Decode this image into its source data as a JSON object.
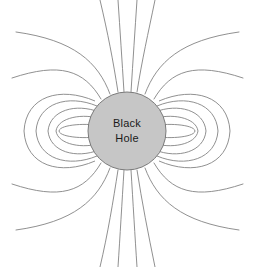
{
  "figure": {
    "width": 254,
    "height": 267,
    "background_color": "#ffffff",
    "caption": ""
  },
  "black_hole": {
    "label_line1": "Black",
    "label_line2": "Hole",
    "center_x": 127,
    "center_y": 131,
    "radius": 39,
    "fill_color": "#c6c6c6",
    "stroke_color": "#7a7a7a",
    "text_color": "#1a1a1a"
  },
  "field": {
    "line_color": "#838383",
    "line_width": 0.9,
    "open_line_count": 12,
    "closed_loop_count": 10,
    "symmetry": "dipole"
  },
  "chart_data": {
    "type": "line",
    "title": "",
    "subtitle": "",
    "xlabel": "",
    "ylabel": "",
    "grid": false,
    "legend": "none",
    "xlim": [
      0,
      254
    ],
    "ylim": [
      0,
      267
    ],
    "annotations": [
      {
        "text": "Black",
        "x": 127,
        "y": 124
      },
      {
        "text": "Hole",
        "x": 127,
        "y": 139
      }
    ],
    "series": [
      {
        "name": "open-field-line-upper-1",
        "path": "M 118 92 C 113 60, 108 34, 100 0"
      },
      {
        "name": "open-field-line-upper-2",
        "path": "M 124 92 C 122 60, 120 30, 118 0"
      },
      {
        "name": "open-field-line-upper-3",
        "path": "M 131 92 C 133 60, 135 30, 137 0"
      },
      {
        "name": "open-field-line-upper-4",
        "path": "M 137 92 C 142 60, 148 34, 155 0"
      },
      {
        "name": "open-field-line-upper-left-5",
        "path": "M 110 94 C 98 62, 74 40, 16 32"
      },
      {
        "name": "open-field-line-upper-left-6",
        "path": "M 101 99 C 84 70, 60 62, 12 78"
      },
      {
        "name": "open-field-line-upper-right-5",
        "path": "M 145 94 C 157 62, 181 40, 239 32"
      },
      {
        "name": "open-field-line-upper-right-6",
        "path": "M 154 99 C 171 70, 195 62, 243 78"
      },
      {
        "name": "open-field-line-lower-1",
        "path": "M 118 170 C 113 202, 108 233, 100 267"
      },
      {
        "name": "open-field-line-lower-2",
        "path": "M 124 170 C 122 202, 120 237, 118 267"
      },
      {
        "name": "open-field-line-lower-3",
        "path": "M 131 170 C 133 202, 135 237, 137 267"
      },
      {
        "name": "open-field-line-lower-4",
        "path": "M 137 170 C 142 202, 148 233, 155 267"
      },
      {
        "name": "open-field-line-lower-left-5",
        "path": "M 110 168 C 98 200, 74 222, 16 230"
      },
      {
        "name": "open-field-line-lower-left-6",
        "path": "M 101 163 C 84 192, 60 200, 12 184"
      },
      {
        "name": "open-field-line-lower-right-5",
        "path": "M 145 168 C 157 200, 181 222, 239 230"
      },
      {
        "name": "open-field-line-lower-right-6",
        "path": "M 154 163 C 171 192, 195 200, 243 184"
      },
      {
        "name": "closed-loop-left-1",
        "path": "M 95 101 C 60 86, 26 96, 24 131 C 26 166, 60 176, 95 161"
      },
      {
        "name": "closed-loop-left-2",
        "path": "M 97 106 C 68 94, 38 103, 36 131 C 38 159, 68 168, 97 156"
      },
      {
        "name": "closed-loop-left-3",
        "path": "M 99 112 C 76 103, 50 110, 48 131 C 50 152, 76 159, 99 150"
      },
      {
        "name": "closed-loop-left-4",
        "path": "M 101 119 C 84 113, 58 117, 56 131 C 58 145, 84 149, 101 143"
      },
      {
        "name": "closed-loop-left-5",
        "path": "M 100 126 C 90 123, 60 124, 59 131 C 60 138, 90 139, 100 136"
      },
      {
        "name": "closed-loop-right-1",
        "path": "M 159 101 C 194 86, 228 96, 230 131 C 228 166, 194 176, 159 161"
      },
      {
        "name": "closed-loop-right-2",
        "path": "M 157 106 C 186 94, 216 103, 218 131 C 216 159, 186 168, 157 156"
      },
      {
        "name": "closed-loop-right-3",
        "path": "M 155 112 C 178 103, 204 110, 206 131 C 204 152, 178 159, 155 150"
      },
      {
        "name": "closed-loop-right-4",
        "path": "M 153 119 C 170 113, 196 117, 198 131 C 196 145, 170 149, 153 143"
      },
      {
        "name": "closed-loop-right-5",
        "path": "M 154 126 C 164 123, 194 124, 195 131 C 194 138, 164 139, 154 136"
      }
    ]
  }
}
